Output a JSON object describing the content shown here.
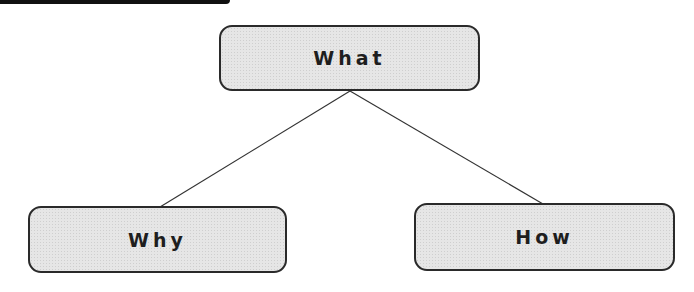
{
  "diagram": {
    "type": "tree",
    "nodes": [
      {
        "id": "what",
        "label": "What",
        "role": "root"
      },
      {
        "id": "why",
        "label": "Why",
        "role": "child"
      },
      {
        "id": "how",
        "label": "How",
        "role": "child"
      }
    ],
    "edges": [
      {
        "from": "what",
        "to": "why"
      },
      {
        "from": "what",
        "to": "how"
      }
    ],
    "colors": {
      "node_fill": "#e6e6e6",
      "node_border": "#2a2a2a",
      "edge": "#333333",
      "text": "#1e1e1e",
      "top_bar": "#111111"
    }
  }
}
